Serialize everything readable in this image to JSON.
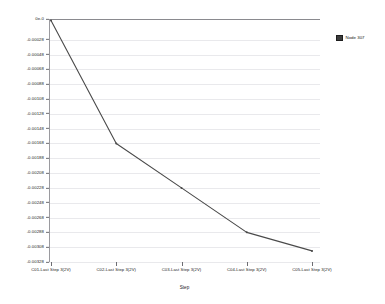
{
  "chart_data": {
    "type": "line",
    "title": "",
    "xlabel": "Step",
    "ylabel": "",
    "categories": [
      "C01-Last Step  3(2V)",
      "C02-Last Step  3(2V)",
      "C03-Last Step  3(2V)",
      "C04-Last Step  3(2V)",
      "C05-Last Step  3(2V)"
    ],
    "series": [
      {
        "name": "Node 307",
        "color": "#4a4a4a",
        "values": [
          -2e-05,
          -0.00168,
          -0.00228,
          -0.00288,
          -0.00313
        ]
      }
    ],
    "ylim": [
      -0.00328,
      0.0
    ],
    "ytick_values": [
      0.0,
      -0.00028,
      -0.00048,
      -0.00068,
      -0.00088,
      -0.00108,
      -0.00128,
      -0.00148,
      -0.00168,
      -0.00188,
      -0.00208,
      -0.00228,
      -0.00248,
      -0.00268,
      -0.00288,
      -0.00308,
      -0.00328
    ],
    "ytick_labels": [
      "0e-0",
      "-0.00028",
      "-0.00048",
      "-0.00068",
      "-0.00088",
      "-0.00108",
      "-0.00128",
      "-0.00148",
      "-0.00168",
      "-0.00188",
      "-0.00208",
      "-0.00228",
      "-0.00248",
      "-0.00268",
      "-0.00288",
      "-0.00308",
      "-0.00328"
    ],
    "grid": true,
    "grid_color": "#e9e9ec",
    "zero_line_color": "#8a8a8f",
    "legend_position": "right",
    "legend_entries": [
      {
        "label": "Node 307",
        "color": "#3c3c3c"
      }
    ]
  }
}
